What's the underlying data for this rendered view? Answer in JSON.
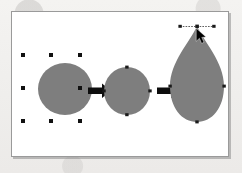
{
  "figure": {
    "title": "Circle to teardrop node-editing sequence",
    "caption": "",
    "background_color": "#f2f1ef",
    "canvas_color": "#ffffff",
    "frame_border_color": "#9a9a9a",
    "shape_fill_color": "#7e7e7e",
    "handle_color": "#111111",
    "arrow_color": "#0d0d0d"
  },
  "steps": [
    {
      "index": 1,
      "name": "selected-circle",
      "label": "Circle with selection handles",
      "shape": "circle",
      "center": [
        53,
        77
      ],
      "radius_x": 27,
      "radius_y": 26,
      "selection_handles": 8,
      "handle_positions": [
        [
          22,
          45
        ],
        [
          53,
          45
        ],
        [
          84,
          45
        ],
        [
          22,
          77
        ],
        [
          84,
          77
        ],
        [
          22,
          109
        ],
        [
          53,
          109
        ],
        [
          84,
          109
        ]
      ]
    },
    {
      "index": 2,
      "name": "path-with-nodes",
      "label": "Circle converted to path with four nodes",
      "shape": "circle",
      "center": [
        115,
        80
      ],
      "radius_x": 23,
      "radius_y": 24,
      "node_count": 4,
      "node_positions": [
        [
          115,
          56
        ],
        [
          139,
          80
        ],
        [
          115,
          104
        ],
        [
          91,
          80
        ]
      ]
    },
    {
      "index": 3,
      "name": "teardrop-result",
      "label": "Top node dragged upward forming a teardrop",
      "shape": "teardrop",
      "center": [
        185,
        72
      ],
      "apex": [
        185,
        22
      ],
      "width": 58,
      "height": 100,
      "node_count": 4,
      "node_positions": [
        [
          185,
          22
        ],
        [
          214,
          78
        ],
        [
          185,
          120
        ],
        [
          156,
          78
        ]
      ],
      "control_handle": {
        "left_point": [
          168,
          22
        ],
        "right_point": [
          202,
          22
        ],
        "dashed": true
      },
      "cursor": {
        "name": "mouse-pointer",
        "position": [
          187,
          24
        ],
        "direction": "up-right"
      }
    }
  ],
  "arrows": [
    {
      "index": 1,
      "name": "arrow-step1-to-step2",
      "from_step": 1,
      "to_step": 2,
      "direction": "right",
      "start": [
        72,
        80
      ],
      "end": [
        88,
        80
      ]
    },
    {
      "index": 2,
      "name": "arrow-step2-to-step3",
      "from_step": 2,
      "to_step": 3,
      "direction": "right",
      "start": [
        141,
        80
      ],
      "end": [
        157,
        80
      ]
    }
  ]
}
